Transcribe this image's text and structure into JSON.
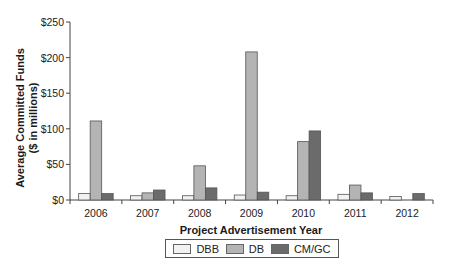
{
  "chart_data": {
    "type": "bar",
    "title": "",
    "xlabel": "Project Advertisement Year",
    "ylabel": "Average Committed Funds ($ in millions)",
    "ylabel_lines": [
      "Average Committed Funds",
      "($ in millions)"
    ],
    "ylim": [
      0,
      250
    ],
    "yticks": [
      0,
      50,
      100,
      150,
      200,
      250
    ],
    "ytick_labels": [
      "$0",
      "$50",
      "$100",
      "$150",
      "$200",
      "$250"
    ],
    "grid": false,
    "legend_position": "bottom",
    "categories": [
      "2006",
      "2007",
      "2008",
      "2009",
      "2010",
      "2011",
      "2012"
    ],
    "series": [
      {
        "name": "DBB",
        "color": "#f2f2f2",
        "values": [
          9,
          6,
          6,
          7,
          6,
          8,
          5
        ]
      },
      {
        "name": "DB",
        "color": "#b4b4b4",
        "values": [
          111,
          10,
          48,
          208,
          82,
          21,
          0
        ]
      },
      {
        "name": "CM/GC",
        "color": "#6b6b6b",
        "values": [
          9,
          14,
          17,
          11,
          97,
          10,
          9
        ]
      }
    ]
  }
}
